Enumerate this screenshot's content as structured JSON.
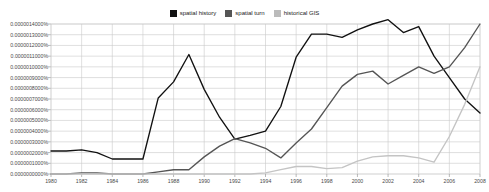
{
  "legend": {
    "position": "top-center",
    "entries": [
      {
        "label": "spatial history",
        "color": "#111111",
        "swatch": "legend-swatch-spatial-history"
      },
      {
        "label": "spatial turn",
        "color": "#555555",
        "swatch": "legend-swatch-spatial-turn"
      },
      {
        "label": "historical GIS",
        "color": "#bbbbbb",
        "swatch": "legend-swatch-historical-gis"
      }
    ]
  },
  "axes": {
    "y_tick_labels": [
      "0.0000014000%",
      "0.0000013000%",
      "0.0000012000%",
      "0.0000011000%",
      "0.0000010000%",
      "0.0000009000%",
      "0.0000008000%",
      "0.0000007000%",
      "0.0000006000%",
      "0.0000005000%",
      "0.0000004000%",
      "0.0000003000%",
      "0.0000002000%",
      "0.0000001000%",
      "0.0000000000%"
    ],
    "x_tick_labels": [
      "1980",
      "1982",
      "1984",
      "1986",
      "1988",
      "1990",
      "1992",
      "1994",
      "1996",
      "1998",
      "2000",
      "2002",
      "2004",
      "2006",
      "2008"
    ]
  },
  "chart_data": {
    "type": "line",
    "title": "",
    "xlabel": "",
    "ylabel": "",
    "xlim": [
      1980,
      2008
    ],
    "ylim": [
      0.0,
      1.4e-06
    ],
    "y_unit": "%",
    "grid": true,
    "legend_position": "top-center",
    "x": [
      1980,
      1981,
      1982,
      1983,
      1984,
      1985,
      1986,
      1987,
      1988,
      1989,
      1990,
      1991,
      1992,
      1993,
      1994,
      1995,
      1996,
      1997,
      1998,
      1999,
      2000,
      2001,
      2002,
      2003,
      2004,
      2005,
      2006,
      2007,
      2008
    ],
    "series": [
      {
        "name": "spatial history",
        "color": "#111111",
        "values": [
          2.15e-07,
          2.15e-07,
          2.25e-07,
          2e-07,
          1.4e-07,
          1.4e-07,
          1.4e-07,
          7.1e-07,
          8.6e-07,
          1.115e-06,
          7.9e-07,
          5.3e-07,
          3.25e-07,
          3.6e-07,
          4e-07,
          6.3e-07,
          1.09e-06,
          1.305e-06,
          1.305e-06,
          1.275e-06,
          1.345e-06,
          1.4e-06,
          1.44e-06,
          1.32e-06,
          1.375e-06,
          1.1e-06,
          9e-07,
          7e-07,
          5.7e-07
        ]
      },
      {
        "name": "spatial turn",
        "color": "#555555",
        "values": [
          0.0,
          0.0,
          1e-08,
          1e-08,
          0.0,
          0.0,
          0.0,
          2e-08,
          4e-08,
          4e-08,
          1.6e-07,
          2.6e-07,
          3.3e-07,
          2.9e-07,
          2.4e-07,
          1.5e-07,
          2.9e-07,
          4.2e-07,
          6.2e-07,
          8.2e-07,
          9.3e-07,
          9.6e-07,
          8.4e-07,
          9.2e-07,
          1e-06,
          9.4e-07,
          1e-06,
          1.18e-06,
          1.4e-06
        ]
      },
      {
        "name": "historical GIS",
        "color": "#c4c4c4",
        "values": [
          0.0,
          0.0,
          0.0,
          0.0,
          0.0,
          0.0,
          0.0,
          0.0,
          0.0,
          0.0,
          0.0,
          0.0,
          0.0,
          0.0,
          1e-08,
          4e-08,
          7e-08,
          7e-08,
          5e-08,
          6e-08,
          1.2e-07,
          1.6e-07,
          1.7e-07,
          1.7e-07,
          1.5e-07,
          1.1e-07,
          3.5e-07,
          6.5e-07,
          1e-06
        ]
      }
    ]
  }
}
